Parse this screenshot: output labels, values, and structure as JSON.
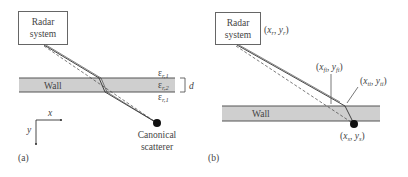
{
  "panel_a": {
    "label": "(a)",
    "radar_box": {
      "line1": "Radar",
      "line2": "system"
    },
    "wall_label": "Wall",
    "permittivity": {
      "top": {
        "sym": "ε",
        "sub": "r,1"
      },
      "middle": {
        "sym": "ε",
        "sub": "r,2"
      },
      "bottom": {
        "sym": "ε",
        "sub": "r,1"
      }
    },
    "thickness_label": "d",
    "axes": {
      "x": "x",
      "y": "y"
    },
    "scatterer": {
      "line1": "Canonical",
      "line2": "scatterer"
    }
  },
  "panel_b": {
    "label": "(b)",
    "radar_box": {
      "line1": "Radar",
      "line2": "system"
    },
    "wall_label": "Wall",
    "points": {
      "radar": {
        "open": "(",
        "x": "x",
        "xs": "r",
        "sep": ", ",
        "y": "y",
        "ys": "r",
        "close": ")"
      },
      "front_i": {
        "open": "(",
        "x": "x",
        "xs": "fi",
        "sep": ", ",
        "y": "y",
        "ys": "fi",
        "close": ")"
      },
      "trans_i": {
        "open": "(",
        "x": "x",
        "xs": "ti",
        "sep": ", ",
        "y": "y",
        "ys": "ti",
        "close": ")"
      },
      "scatterer": {
        "open": "(",
        "x": "x",
        "xs": "s",
        "sep": ", ",
        "y": "y",
        "ys": "s",
        "close": ")"
      }
    }
  },
  "colors": {
    "wall_fill": "#cfcfcf",
    "wall_edge": "#555555",
    "line": "#333333",
    "text": "#444444"
  }
}
